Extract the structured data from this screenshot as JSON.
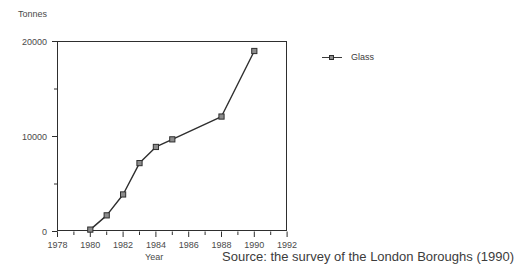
{
  "chart_data": {
    "type": "line",
    "title": "",
    "xlabel": "Year",
    "ylabel": "Tonnes",
    "xlim": [
      1978,
      1992
    ],
    "ylim": [
      0,
      20000
    ],
    "grid": false,
    "legend_position": "right",
    "x_ticks_major": [
      1978,
      1980,
      1982,
      1984,
      1986,
      1988,
      1990,
      1992
    ],
    "x_ticks_minor": [
      1979,
      1981,
      1983,
      1985,
      1987,
      1989,
      1991
    ],
    "y_ticks_major": [
      0,
      10000,
      20000
    ],
    "y_ticks_minor": [
      5000,
      15000
    ],
    "series": [
      {
        "name": "Glass",
        "marker": "square",
        "color": "#2e2e2e",
        "marker_fill": "#8c8c8c",
        "x": [
          1980,
          1981,
          1982,
          1983,
          1984,
          1985,
          1988,
          1990
        ],
        "values": [
          200,
          1700,
          3900,
          7200,
          8900,
          9700,
          12100,
          19000
        ]
      }
    ],
    "annotations": [
      "Source: the survey of the London Boroughs (1990)"
    ]
  },
  "labels": {
    "y_axis_name": "Tonnes",
    "x_axis_name": "Year",
    "source_note": "Source: the survey of the London Boroughs (1990)",
    "legend_glass": "Glass"
  },
  "ticks": {
    "y": [
      "20000",
      "10000",
      "0"
    ],
    "x": [
      "1978",
      "1980",
      "1982",
      "1984",
      "1986",
      "1988",
      "1990",
      "1992"
    ]
  }
}
